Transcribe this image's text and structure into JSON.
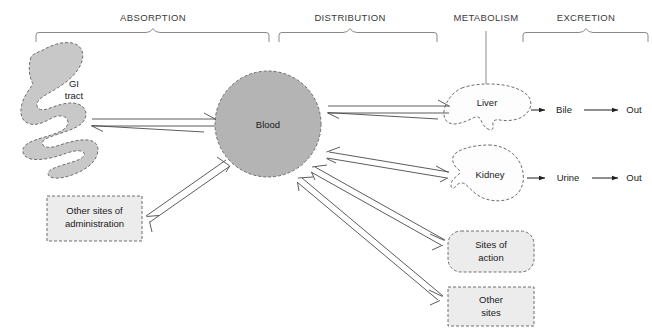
{
  "diagram": {
    "phases": [
      {
        "id": "absorption",
        "label": "ABSORPTION",
        "bracket": true,
        "x": 153,
        "y": 18
      },
      {
        "id": "distribution",
        "label": "DISTRIBUTION",
        "bracket": true,
        "x": 350,
        "y": 18
      },
      {
        "id": "metabolism",
        "label": "METABOLISM",
        "bracket": false,
        "x": 486,
        "y": 18
      },
      {
        "id": "excretion",
        "label": "EXCRETION",
        "bracket": true,
        "x": 586,
        "y": 18
      }
    ],
    "nodes": [
      {
        "id": "gi-tract",
        "label_line1": "GI",
        "label_line2": "tract",
        "shape": "gi-tract",
        "fill": "#c8c8c8"
      },
      {
        "id": "blood",
        "label_line1": "Blood",
        "label_line2": "",
        "shape": "circle",
        "fill": "#b4b4b4"
      },
      {
        "id": "other-admin",
        "label_line1": "Other sites of",
        "label_line2": "administration",
        "shape": "rect",
        "fill": "#ececec"
      },
      {
        "id": "liver",
        "label_line1": "Liver",
        "label_line2": "",
        "shape": "liver",
        "fill": "#fdfdfd"
      },
      {
        "id": "kidney",
        "label_line1": "Kidney",
        "label_line2": "",
        "shape": "kidney",
        "fill": "#fdfdfd"
      },
      {
        "id": "sites-action",
        "label_line1": "Sites of",
        "label_line2": "action",
        "shape": "round-rect",
        "fill": "#ececec"
      },
      {
        "id": "other-sites",
        "label_line1": "Other",
        "label_line2": "sites",
        "shape": "rect",
        "fill": "#ececec"
      }
    ],
    "flow_labels": [
      {
        "id": "bile",
        "label": "Bile",
        "x": 564,
        "y": 110
      },
      {
        "id": "out-bile",
        "label": "Out",
        "x": 634,
        "y": 110
      },
      {
        "id": "urine",
        "label": "Urine",
        "x": 568,
        "y": 178
      },
      {
        "id": "out-urine",
        "label": "Out",
        "x": 634,
        "y": 178
      }
    ],
    "edges": [
      {
        "id": "gi-to-blood",
        "from": "gi-tract",
        "to": "blood",
        "style": "double-open",
        "bidirectional": true
      },
      {
        "id": "other-admin-to-blood",
        "from": "other-admin",
        "to": "blood",
        "style": "double-open",
        "bidirectional": true
      },
      {
        "id": "blood-to-liver",
        "from": "blood",
        "to": "liver",
        "style": "double-open",
        "bidirectional": true
      },
      {
        "id": "blood-to-kidney",
        "from": "blood",
        "to": "kidney",
        "style": "double-open",
        "bidirectional": true
      },
      {
        "id": "blood-to-sites-action",
        "from": "blood",
        "to": "sites-action",
        "style": "double-open",
        "bidirectional": true
      },
      {
        "id": "blood-to-other-sites",
        "from": "blood",
        "to": "other-sites",
        "style": "double-open",
        "bidirectional": true
      },
      {
        "id": "liver-to-bile",
        "from": "liver",
        "to": "bile",
        "style": "solid",
        "bidirectional": false
      },
      {
        "id": "bile-to-out",
        "from": "bile",
        "to": "out-bile",
        "style": "solid",
        "bidirectional": false
      },
      {
        "id": "kidney-to-urine",
        "from": "kidney",
        "to": "urine",
        "style": "solid",
        "bidirectional": false
      },
      {
        "id": "urine-to-out",
        "from": "urine",
        "to": "out-urine",
        "style": "solid",
        "bidirectional": false
      },
      {
        "id": "metabolism-to-liver",
        "from": "metabolism",
        "to": "liver",
        "style": "plain-line",
        "bidirectional": false
      }
    ],
    "colors": {
      "blood": "#b4b4b4",
      "gi_tract": "#c8c8c8",
      "box": "#ececec",
      "organ_outline": "#6e6e6e",
      "bracket": "#8a8a8a",
      "arrow": "#4a4a4a",
      "text": "#1a1a1a"
    }
  }
}
